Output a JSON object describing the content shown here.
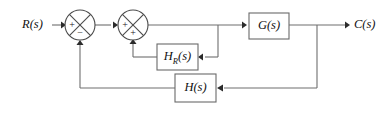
{
  "diagram": {
    "type": "control-system-block-diagram",
    "colors": {
      "wire": "#6e6e6e",
      "outline": "#4a4a4a",
      "text": "#111111",
      "background": "#ffffff"
    },
    "io": {
      "input_label": "R(s)",
      "output_label": "C(s)"
    },
    "summing_junctions": [
      {
        "id": "summer-1",
        "input_sign": "+",
        "feedback_sign": "−",
        "cx": 80,
        "cy": 25,
        "r": 15
      },
      {
        "id": "summer-2",
        "input_sign": "+",
        "feedback_sign": "+",
        "cx": 133,
        "cy": 25,
        "r": 15
      }
    ],
    "blocks": [
      {
        "id": "block-g",
        "label": "G(s)",
        "base": "G",
        "subscript": "",
        "suffix": "(s)",
        "x": 249,
        "y": 13,
        "w": 40,
        "h": 26
      },
      {
        "id": "block-hr",
        "label": "H_R(s)",
        "base": "H",
        "subscript": "R",
        "suffix": "(s)",
        "x": 157,
        "y": 44,
        "w": 41,
        "h": 26
      },
      {
        "id": "block-h",
        "label": "H(s)",
        "base": "H",
        "subscript": "",
        "suffix": "(s)",
        "x": 175,
        "y": 74,
        "w": 41,
        "h": 28
      }
    ],
    "signals": [
      {
        "id": "wire-input",
        "from": "R(s)",
        "to": "summer-1"
      },
      {
        "id": "wire-summer1-summer2",
        "from": "summer-1",
        "to": "summer-2"
      },
      {
        "id": "wire-summer2-g",
        "from": "summer-2",
        "to": "block-g"
      },
      {
        "id": "wire-g-output",
        "from": "block-g",
        "to": "C(s)"
      },
      {
        "id": "wire-inner-feedback",
        "from": "block-g-input-tap",
        "to": "block-hr"
      },
      {
        "id": "wire-hr-summer2",
        "from": "block-hr",
        "to": "summer-2"
      },
      {
        "id": "wire-outer-tap-h",
        "from": "output-tap",
        "to": "block-h"
      },
      {
        "id": "wire-h-summer1",
        "from": "block-h",
        "to": "summer-1"
      }
    ]
  }
}
